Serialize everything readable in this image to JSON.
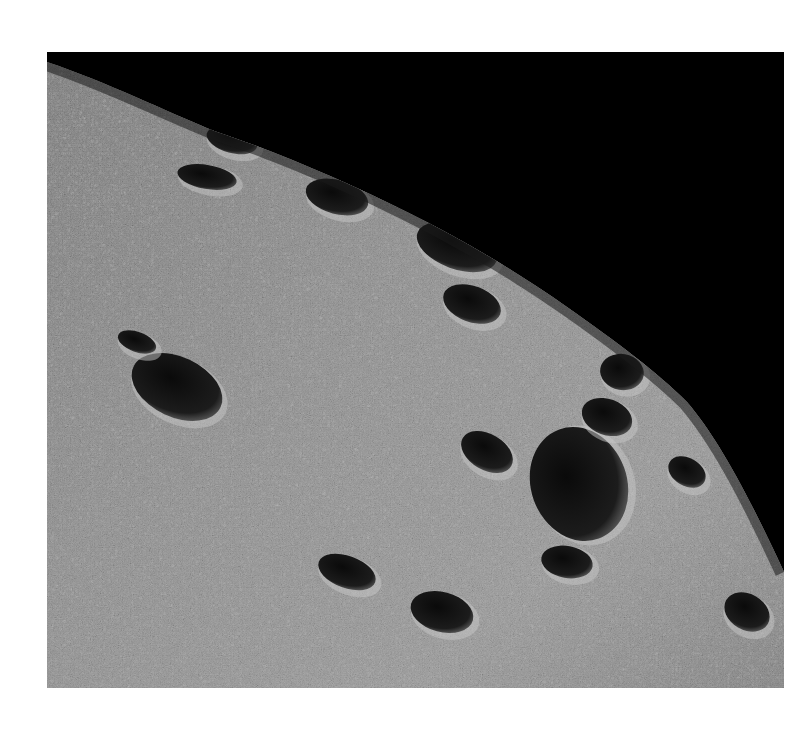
{
  "image": {
    "subject": "cratered planetary surface limb against black space",
    "frame": {
      "x": 47,
      "y": 52,
      "width": 737,
      "height": 636
    },
    "colors": {
      "sky": "#000000",
      "surface_base": "#8a8a8a",
      "surface_light": "#c8c8c8",
      "surface_dark": "#4a4a4a",
      "crater_shadow": "#101010",
      "page_background": "#ffffff"
    },
    "craters": [
      {
        "cx": 130,
        "cy": 335,
        "rx": 48,
        "ry": 30,
        "rot": 25
      },
      {
        "cx": 532,
        "cy": 432,
        "rx": 48,
        "ry": 58,
        "rot": -20
      },
      {
        "cx": 410,
        "cy": 195,
        "rx": 42,
        "ry": 22,
        "rot": 20
      },
      {
        "cx": 290,
        "cy": 145,
        "rx": 32,
        "ry": 17,
        "rot": 15
      },
      {
        "cx": 185,
        "cy": 88,
        "rx": 26,
        "ry": 13,
        "rot": 15
      },
      {
        "cx": 425,
        "cy": 252,
        "rx": 30,
        "ry": 18,
        "rot": 20
      },
      {
        "cx": 575,
        "cy": 320,
        "rx": 22,
        "ry": 18,
        "rot": 10
      },
      {
        "cx": 560,
        "cy": 365,
        "rx": 26,
        "ry": 18,
        "rot": 20
      },
      {
        "cx": 440,
        "cy": 400,
        "rx": 28,
        "ry": 18,
        "rot": 30
      },
      {
        "cx": 300,
        "cy": 520,
        "rx": 30,
        "ry": 16,
        "rot": 20
      },
      {
        "cx": 395,
        "cy": 560,
        "rx": 32,
        "ry": 20,
        "rot": 15
      },
      {
        "cx": 520,
        "cy": 510,
        "rx": 26,
        "ry": 16,
        "rot": 10
      },
      {
        "cx": 640,
        "cy": 420,
        "rx": 20,
        "ry": 14,
        "rot": 30
      },
      {
        "cx": 700,
        "cy": 560,
        "rx": 24,
        "ry": 18,
        "rot": 30
      },
      {
        "cx": 160,
        "cy": 125,
        "rx": 30,
        "ry": 12,
        "rot": 10
      },
      {
        "cx": 90,
        "cy": 290,
        "rx": 20,
        "ry": 10,
        "rot": 20
      }
    ]
  }
}
